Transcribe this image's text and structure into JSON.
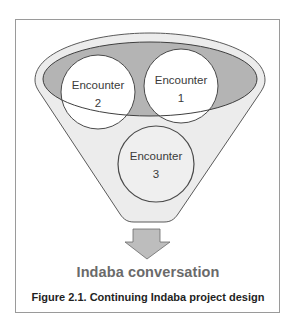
{
  "figure": {
    "encounters": [
      {
        "id": "encounter-1",
        "line1": "Encounter",
        "line2": "1"
      },
      {
        "id": "encounter-2",
        "line1": "Encounter",
        "line2": "2"
      },
      {
        "id": "encounter-3",
        "line1": "Encounter",
        "line2": "3"
      }
    ],
    "output_label": "Indaba conversation",
    "caption": "Figure 2.1. Continuing Indaba project design",
    "colors": {
      "funnel_fill": "#ececec",
      "ellipse_fill": "#b4b4b4",
      "circle_fill": "#ffffff",
      "arrow_fill": "#bdbdbd",
      "stroke": "#555555"
    }
  }
}
